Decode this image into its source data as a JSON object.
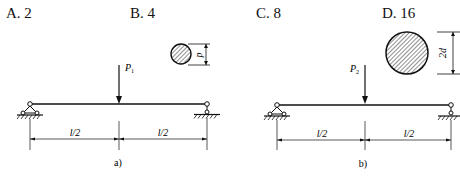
{
  "question": {
    "options": [
      {
        "key": "A",
        "label": "A. 2"
      },
      {
        "key": "B",
        "label": "B. 4"
      },
      {
        "key": "C",
        "label": "C. 8"
      },
      {
        "key": "D",
        "label": "D. 16"
      }
    ]
  },
  "figures": [
    {
      "id": "a",
      "caption": "a)",
      "load_label": "P",
      "load_subscript": "1",
      "section_dim": "d",
      "spans": [
        "l/2",
        "l/2"
      ]
    },
    {
      "id": "b",
      "caption": "b)",
      "load_label": "P",
      "load_subscript": "2",
      "section_dim": "2d",
      "spans": [
        "l/2",
        "l/2"
      ]
    }
  ]
}
